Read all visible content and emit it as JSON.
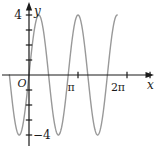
{
  "figure": {
    "labels": {
      "x_axis": "x",
      "y_axis": "y",
      "origin": "O",
      "y_max": "4",
      "y_min": "−4",
      "x_pi": "π",
      "x_2pi": "2π"
    },
    "colors": {
      "axis": "#1a1a1a",
      "curve": "#999999",
      "text": "#1a1a1a",
      "background": "#ffffff"
    }
  },
  "chart_data": {
    "type": "line",
    "title": "",
    "xlabel": "x",
    "ylabel": "y",
    "function": "y = 4 sin(2.5x)",
    "amplitude": 4,
    "angular_frequency": 2.5,
    "period_pi": 0.8,
    "domain_pi": [
      -0.4,
      1.8
    ],
    "ylim": [
      -5,
      5
    ],
    "grid": false,
    "legend": false,
    "x_ticks_pi": [
      {
        "v": 1,
        "label": "π"
      },
      {
        "v": 2,
        "label": "2π"
      },
      {
        "v": 2.47,
        "label": ""
      }
    ],
    "y_ticks": [
      1,
      2,
      3,
      4,
      -1,
      -2,
      -3,
      -4
    ],
    "y_labeled_ticks": [
      {
        "v": 4,
        "label": "4"
      },
      {
        "v": -4,
        "label": "−4"
      }
    ],
    "key_points": {
      "zeros_x_pi": [
        -0.4,
        0,
        0.4,
        0.8,
        1.2,
        1.6
      ],
      "maxima": [
        {
          "x_pi": 0.2,
          "y": 4
        },
        {
          "x_pi": 1.0,
          "y": 4
        },
        {
          "x_pi": 1.8,
          "y": 4
        }
      ],
      "minima": [
        {
          "x_pi": -0.2,
          "y": -4
        },
        {
          "x_pi": 0.6,
          "y": -4
        },
        {
          "x_pi": 1.4,
          "y": -4
        }
      ]
    }
  }
}
